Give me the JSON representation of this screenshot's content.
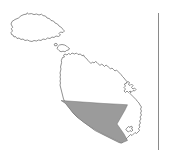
{
  "figure": {
    "type": "map",
    "caption": "",
    "width": 169,
    "height": 162,
    "background_color": "#ffffff"
  },
  "style": {
    "coastline_stroke": "#555555",
    "coastline_fill": "#ffffff",
    "highlight_fill": "#9b9b9b",
    "highlight_stroke": "#6e6e6e",
    "divider_stroke": "#8a8a8a"
  },
  "islands": [
    {
      "name": "gozo",
      "label": "Gozo",
      "position": "northwest",
      "path": "M 12.5 27.0 L 11.0 24.0 L 12.0 21.5 L 15.0 19.5 L 18.5 18.0 L 21.0 15.8 L 24.0 14.5 L 26.5 14.2 L 27.2 12.8 L 28.5 14.0 L 31.5 13.6 L 34.0 14.6 L 36.5 14.0 L 39.0 15.0 L 41.5 14.2 L 43.0 15.6 L 45.5 16.0 L 47.0 18.0 L 49.5 18.6 L 51.0 20.5 L 53.5 21.0 L 55.0 23.0 L 57.5 24.0 L 59.0 26.0 L 61.5 27.5 L 63.0 29.5 L 64.5 31.0 L 63.0 32.5 L 60.5 32.0 L 59.0 33.5 L 60.5 35.0 L 58.5 36.5 L 56.0 36.0 L 54.0 37.5 L 52.0 37.0 L 50.0 38.5 L 47.5 38.0 L 45.5 39.5 L 43.0 39.0 L 41.0 40.5 L 38.5 40.0 L 36.5 41.0 L 34.0 40.5 L 32.0 41.5 L 29.5 41.0 L 27.5 40.0 L 25.0 40.5 L 23.0 39.0 L 21.0 39.5 L 19.0 38.0 L 17.0 38.5 L 15.5 36.5 L 14.0 37.0 L 13.0 35.0 L 11.5 34.5 L 11.0 32.5 L 12.5 31.0 L 11.5 29.0 Z"
    },
    {
      "name": "comino",
      "label": "Comino",
      "position": "central-channel",
      "path": "M 58.0 46.5 L 59.5 45.0 L 62.0 44.5 L 64.5 45.0 L 66.5 46.0 L 68.0 47.5 L 69.5 48.5 L 68.5 50.0 L 66.5 50.5 L 65.0 51.8 L 63.0 51.2 L 61.0 51.8 L 59.0 50.5 L 57.5 49.0 Z"
    },
    {
      "name": "cominotto",
      "label": "Cominotto",
      "position": "west-of-comino",
      "path": "M 54.5 44.0 L 56.0 43.2 L 57.3 44.2 L 56.8 45.6 L 55.2 45.8 Z"
    },
    {
      "name": "malta",
      "label": "Malta",
      "position": "southeast",
      "path": "M 61.5 60.0 L 62.5 57.5 L 64.5 57.0 L 63.5 55.2 L 65.0 54.0 L 67.0 55.0 L 68.5 53.5 L 70.5 54.5 L 72.0 53.0 L 74.5 54.0 L 76.5 53.0 L 78.0 54.5 L 80.5 54.0 L 82.0 55.8 L 83.5 55.0 L 84.5 57.0 L 86.5 58.5 L 88.0 60.5 L 89.5 62.0 L 91.0 63.5 L 92.5 62.0 L 94.0 63.0 L 95.5 61.5 L 97.0 62.5 L 98.5 64.0 L 100.0 65.5 L 101.5 64.0 L 103.0 65.0 L 104.5 66.5 L 106.0 65.0 L 107.5 66.0 L 109.0 67.5 L 110.5 69.0 L 112.0 68.0 L 113.5 69.5 L 115.0 71.0 L 116.5 70.0 L 118.0 71.5 L 119.5 73.0 L 121.0 74.5 L 122.5 76.5 L 124.0 78.0 L 125.5 80.0 L 127.0 81.5 L 126.0 83.5 L 127.5 85.0 L 129.0 86.5 L 128.0 88.5 L 129.5 90.0 L 131.0 91.5 L 130.0 93.5 L 131.5 95.0 L 133.0 96.5 L 134.5 98.0 L 136.0 99.5 L 137.5 101.5 L 139.0 103.0 L 140.0 105.0 L 141.5 107.0 L 140.5 109.0 L 141.5 111.0 L 140.5 113.0 L 141.5 115.0 L 140.0 117.0 L 141.0 119.0 L 139.5 121.0 L 140.5 123.0 L 139.0 125.0 L 140.0 127.0 L 138.5 128.5 L 139.5 130.5 L 138.0 132.0 L 136.5 133.5 L 135.0 132.5 L 133.5 134.0 L 132.0 135.5 L 130.5 134.5 L 129.0 136.0 L 127.5 137.5 L 126.0 139.0 L 124.5 140.5 L 123.0 142.0 L 121.0 143.0 L 119.0 142.5 L 117.0 141.5 L 115.0 140.5 L 113.0 139.5 L 111.0 138.5 L 109.0 137.5 L 107.0 136.5 L 105.0 135.5 L 103.0 134.5 L 101.0 133.5 L 99.0 132.5 L 97.0 131.5 L 95.0 130.5 L 93.0 129.0 L 91.0 127.5 L 89.0 126.0 L 87.0 124.5 L 85.0 123.0 L 83.0 121.5 L 81.0 120.0 L 79.0 118.5 L 77.0 117.0 L 75.0 115.0 L 73.0 113.0 L 71.5 111.0 L 70.0 109.0 L 68.5 107.0 L 67.0 105.0 L 65.5 103.0 L 64.5 101.0 L 63.5 99.0 L 63.0 97.0 L 62.5 95.0 L 62.0 93.0 L 61.5 91.0 L 61.0 89.0 L 60.5 87.0 L 60.0 85.0 L 60.5 83.0 L 60.0 81.0 L 60.5 79.0 L 60.0 77.0 L 60.5 75.0 L 60.0 73.0 L 60.5 71.0 L 61.0 69.0 L 60.5 67.0 L 61.0 65.0 L 61.5 63.0 Z"
    }
  ],
  "inlets": [
    {
      "name": "grand-harbour-detail",
      "label": "Grand Harbour inlets",
      "path": "M 126.5 83.0 L 128.0 81.5 L 129.5 82.5 L 128.5 84.5 L 130.0 85.5 L 131.5 84.0 L 133.0 85.5 L 131.5 87.5 L 133.0 89.0 L 134.5 88.0 L 136.0 89.5 L 134.5 91.0 L 133.0 90.5 L 131.5 92.0 L 130.0 91.0 L 128.5 92.5 L 127.0 91.0 L 125.5 92.5 L 124.0 91.0 L 125.5 89.0 L 124.0 87.5 L 125.5 86.0 L 124.5 84.5 Z"
    },
    {
      "name": "marsaxlokk-bay-detail",
      "label": "Marsaxlokk inlets",
      "path": "M 127.0 128.0 L 128.5 126.5 L 130.0 127.5 L 131.0 126.0 L 132.5 127.0 L 131.5 129.0 L 133.0 130.0 L 131.5 131.5 L 130.0 130.5 L 128.5 132.0 L 127.0 131.0 L 126.0 129.5 Z"
    }
  ],
  "highlight": {
    "name": "shaded-district",
    "label": "Shaded region (southwest Malta)",
    "fill": "#9b9b9b",
    "path": "M 61.0 100.5 L 75.0 101.5 L 90.0 102.5 L 104.0 103.5 L 118.0 104.2 L 127.5 104.8 L 125.0 110.0 L 121.0 117.0 L 117.0 124.0 L 124.0 134.0 L 127.5 140.5 L 121.5 143.0 L 113.0 139.0 L 103.0 134.0 L 93.0 128.5 L 84.0 122.5 L 76.0 116.0 L 70.5 109.5 L 65.5 103.5 Z"
  },
  "divider": {
    "name": "vertical-rule",
    "label": "Vertical rule",
    "x": 158.5,
    "y_top": 13,
    "y_bottom": 150
  }
}
